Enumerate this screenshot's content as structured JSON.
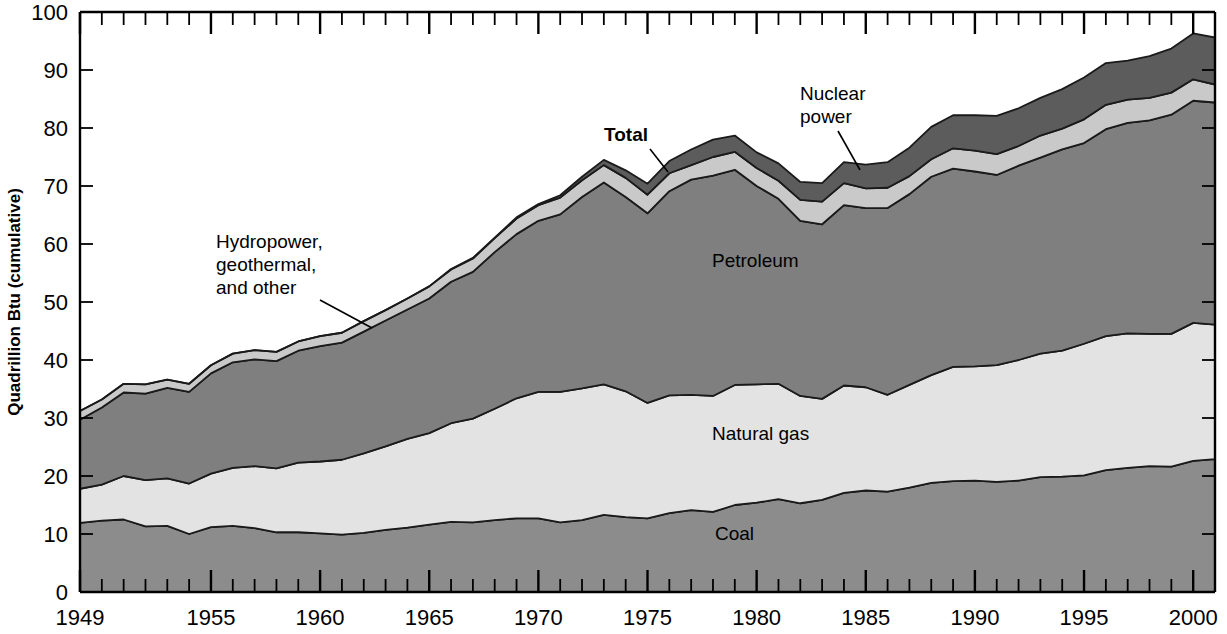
{
  "axes": {
    "y_label": "Quadrillion Btu (cumulative)",
    "y_ticks": [
      "0",
      "10",
      "20",
      "30",
      "40",
      "50",
      "60",
      "70",
      "80",
      "90",
      "100"
    ],
    "x_ticks": [
      "1949",
      "1955",
      "1960",
      "1965",
      "1970",
      "1975",
      "1980",
      "1985",
      "1990",
      "1995",
      "2000"
    ]
  },
  "annotations": {
    "total": "Total",
    "nuclear": "Nuclear\npower",
    "nuclear_line1": "Nuclear",
    "nuclear_line2": "power",
    "hydro_line1": "Hydropower,",
    "hydro_line2": "geothermal,",
    "hydro_line3": "and other",
    "petroleum": "Petroleum",
    "natural_gas": "Natural gas",
    "coal": "Coal"
  },
  "colors": {
    "coal": "#8c8c8c",
    "natural_gas": "#e3e3e3",
    "petroleum": "#7f7f7f",
    "hydro": "#c9c9c9",
    "nuclear": "#5c5c5c",
    "outline": "#1a1a1a",
    "background": "#ffffff"
  },
  "chart_data": {
    "type": "area",
    "title": "",
    "xlabel": "",
    "ylabel": "Quadrillion Btu (cumulative)",
    "xlim": [
      1949,
      2001
    ],
    "ylim": [
      0,
      100
    ],
    "grid": false,
    "legend_position": "inline-annotations",
    "stacked": true,
    "x": [
      1949,
      1950,
      1951,
      1952,
      1953,
      1954,
      1955,
      1956,
      1957,
      1958,
      1959,
      1960,
      1961,
      1962,
      1963,
      1964,
      1965,
      1966,
      1967,
      1968,
      1969,
      1970,
      1971,
      1972,
      1973,
      1974,
      1975,
      1976,
      1977,
      1978,
      1979,
      1980,
      1981,
      1982,
      1983,
      1984,
      1985,
      1986,
      1987,
      1988,
      1989,
      1990,
      1991,
      1992,
      1993,
      1994,
      1995,
      1996,
      1997,
      1998,
      1999,
      2000,
      2001
    ],
    "series": [
      {
        "name": "Coal",
        "values": [
          11.9,
          12.3,
          12.5,
          11.3,
          11.4,
          10.0,
          11.2,
          11.4,
          11.0,
          10.3,
          10.3,
          10.1,
          9.9,
          10.2,
          10.7,
          11.1,
          11.6,
          12.1,
          12.0,
          12.4,
          12.7,
          12.7,
          12.0,
          12.4,
          13.3,
          12.9,
          12.7,
          13.6,
          14.1,
          13.8,
          15.0,
          15.4,
          16.0,
          15.3,
          15.9,
          17.1,
          17.5,
          17.3,
          18.0,
          18.8,
          19.1,
          19.2,
          19.0,
          19.2,
          19.8,
          19.9,
          20.1,
          21.0,
          21.4,
          21.7,
          21.6,
          22.6,
          22.9
        ]
      },
      {
        "name": "Natural gas",
        "values": [
          5.9,
          6.2,
          7.5,
          8.0,
          8.2,
          8.7,
          9.2,
          10.0,
          10.7,
          11.0,
          12.0,
          12.4,
          12.9,
          13.7,
          14.4,
          15.3,
          15.8,
          17.0,
          17.9,
          19.2,
          20.7,
          21.8,
          22.5,
          22.7,
          22.5,
          21.7,
          19.9,
          20.3,
          19.9,
          20.0,
          20.7,
          20.4,
          19.9,
          18.5,
          17.4,
          18.5,
          17.8,
          16.7,
          17.7,
          18.6,
          19.7,
          19.7,
          20.1,
          20.8,
          21.3,
          21.7,
          22.7,
          23.1,
          23.2,
          22.8,
          22.9,
          23.8,
          23.2
        ]
      },
      {
        "name": "Petroleum",
        "values": [
          11.9,
          13.3,
          14.4,
          14.9,
          15.6,
          15.8,
          17.3,
          18.2,
          18.4,
          18.5,
          19.3,
          19.9,
          20.2,
          21.0,
          21.7,
          22.3,
          23.2,
          24.4,
          25.3,
          27.0,
          28.3,
          29.5,
          30.6,
          33.0,
          34.8,
          33.5,
          32.7,
          35.2,
          37.1,
          38.0,
          37.1,
          34.2,
          31.9,
          30.2,
          30.1,
          31.1,
          30.9,
          32.2,
          32.9,
          34.2,
          34.2,
          33.6,
          32.8,
          33.5,
          33.8,
          34.7,
          34.6,
          35.7,
          36.3,
          36.8,
          37.8,
          38.3,
          38.3
        ]
      },
      {
        "name": "Hydropower, geothermal, and other",
        "values": [
          1.5,
          1.4,
          1.5,
          1.6,
          1.4,
          1.4,
          1.4,
          1.5,
          1.6,
          1.6,
          1.6,
          1.7,
          1.7,
          1.8,
          1.8,
          1.9,
          2.1,
          2.1,
          2.3,
          2.4,
          2.7,
          2.7,
          2.9,
          2.9,
          3.0,
          3.3,
          3.2,
          3.1,
          2.5,
          3.2,
          3.1,
          3.1,
          3.1,
          3.6,
          3.9,
          3.8,
          3.4,
          3.5,
          3.1,
          3.0,
          3.5,
          3.6,
          3.6,
          3.4,
          3.8,
          3.6,
          4.1,
          4.2,
          4.0,
          3.9,
          3.8,
          3.7,
          3.1
        ]
      },
      {
        "name": "Nuclear power",
        "values": [
          0.0,
          0.0,
          0.0,
          0.0,
          0.0,
          0.0,
          0.0,
          0.0,
          0.0,
          0.0,
          0.0,
          0.0,
          0.0,
          0.0,
          0.0,
          0.0,
          0.0,
          0.1,
          0.1,
          0.1,
          0.2,
          0.2,
          0.4,
          0.6,
          0.9,
          1.3,
          1.9,
          2.1,
          2.7,
          3.0,
          2.8,
          2.7,
          3.0,
          3.1,
          3.2,
          3.6,
          4.1,
          4.4,
          4.9,
          5.6,
          5.7,
          6.1,
          6.6,
          6.5,
          6.5,
          6.8,
          7.2,
          7.2,
          6.7,
          7.2,
          7.6,
          7.9,
          8.1
        ]
      }
    ],
    "totals": [
      31.2,
      33.2,
      35.9,
      35.8,
      36.6,
      35.9,
      39.1,
      41.1,
      41.7,
      41.4,
      43.2,
      44.1,
      44.7,
      46.7,
      48.6,
      50.6,
      52.7,
      55.7,
      57.6,
      61.1,
      64.6,
      66.9,
      68.4,
      71.6,
      74.5,
      72.7,
      70.4,
      74.3,
      76.3,
      78.0,
      78.7,
      75.8,
      73.9,
      70.7,
      70.5,
      74.1,
      73.7,
      74.1,
      76.6,
      80.2,
      82.2,
      82.2,
      82.1,
      83.4,
      85.2,
      86.7,
      88.7,
      91.2,
      91.6,
      92.4,
      93.7,
      96.3,
      95.6
    ]
  }
}
